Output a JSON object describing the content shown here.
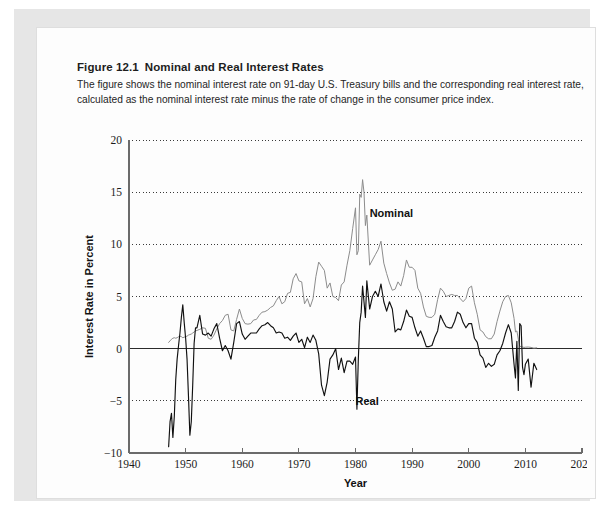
{
  "figure": {
    "number": "Figure 12.1",
    "title": "Nominal and Real Interest Rates",
    "description": "The figure shows the nominal interest rate on 91-day U.S. Treasury bills and the corresponding real interest rate, calculated as the nominal interest rate minus the rate of change in the consumer price index."
  },
  "colors": {
    "nominal": "#8c8c8c",
    "real": "#111111",
    "gridline": "#3a3a3a",
    "axis": "#6b6b6b",
    "zero_line": "#2b2b2b",
    "page_background": "#e6e6e6",
    "card_background": "#fdfdfd"
  },
  "chart_data": {
    "type": "line",
    "title": "Nominal and Real Interest Rates",
    "xlabel": "Year",
    "ylabel": "Interest Rate in Percent",
    "xlim": [
      1940,
      2020
    ],
    "ylim": [
      -10,
      20
    ],
    "xticks": [
      1940,
      1950,
      1960,
      1970,
      1980,
      1990,
      2000,
      2010,
      2020
    ],
    "yticks": [
      -10,
      -5,
      0,
      5,
      10,
      15,
      20
    ],
    "grid": "horizontal-dotted",
    "legend": "inline-annotations",
    "annotations": [
      {
        "text": "Nominal",
        "x": 1982.5,
        "y": 12.6
      },
      {
        "text": "Real",
        "x": 1980.0,
        "y": -5.4
      }
    ],
    "x": [
      1947.0,
      1947.25,
      1947.5,
      1947.75,
      1948.0,
      1948.25,
      1948.5,
      1948.75,
      1949.0,
      1949.25,
      1949.5,
      1949.75,
      1950.0,
      1950.25,
      1950.5,
      1950.75,
      1951.0,
      1951.25,
      1951.5,
      1951.75,
      1952.0,
      1952.5,
      1953.0,
      1953.5,
      1954.0,
      1954.5,
      1955.0,
      1955.5,
      1956.0,
      1956.5,
      1957.0,
      1957.5,
      1958.0,
      1958.5,
      1959.0,
      1959.5,
      1960.0,
      1960.5,
      1961.0,
      1961.5,
      1962.0,
      1962.5,
      1963.0,
      1963.5,
      1964.0,
      1964.5,
      1965.0,
      1965.5,
      1966.0,
      1966.5,
      1967.0,
      1967.5,
      1968.0,
      1968.5,
      1969.0,
      1969.5,
      1970.0,
      1970.5,
      1971.0,
      1971.5,
      1972.0,
      1972.5,
      1973.0,
      1973.5,
      1974.0,
      1974.5,
      1975.0,
      1975.5,
      1976.0,
      1976.5,
      1977.0,
      1977.5,
      1978.0,
      1978.5,
      1979.0,
      1979.5,
      1980.0,
      1980.25,
      1980.5,
      1980.75,
      1981.0,
      1981.25,
      1981.5,
      1981.75,
      1982.0,
      1982.5,
      1983.0,
      1983.5,
      1984.0,
      1984.5,
      1985.0,
      1985.5,
      1986.0,
      1986.5,
      1987.0,
      1987.5,
      1988.0,
      1988.5,
      1989.0,
      1989.5,
      1990.0,
      1990.5,
      1991.0,
      1991.5,
      1992.0,
      1992.5,
      1993.0,
      1993.5,
      1994.0,
      1994.5,
      1995.0,
      1995.5,
      1996.0,
      1996.5,
      1997.0,
      1997.5,
      1998.0,
      1998.5,
      1999.0,
      1999.5,
      2000.0,
      2000.5,
      2001.0,
      2001.5,
      2002.0,
      2002.5,
      2003.0,
      2003.5,
      2004.0,
      2004.5,
      2005.0,
      2005.5,
      2006.0,
      2006.5,
      2007.0,
      2007.5,
      2008.0,
      2008.25,
      2008.5,
      2008.75,
      2009.0,
      2009.25,
      2009.5,
      2009.75,
      2010.0,
      2010.5,
      2011.0,
      2011.5,
      2012.0
    ],
    "series": [
      {
        "name": "Nominal",
        "color": "#8c8c8c",
        "values": [
          0.6,
          0.75,
          0.9,
          1.0,
          1.05,
          1.0,
          1.05,
          1.15,
          1.2,
          1.15,
          1.05,
          1.1,
          1.15,
          1.2,
          1.3,
          1.35,
          1.4,
          1.5,
          1.6,
          1.7,
          1.75,
          1.85,
          2.0,
          1.95,
          1.0,
          0.9,
          1.3,
          1.9,
          2.4,
          2.7,
          3.2,
          3.3,
          1.8,
          1.7,
          2.8,
          3.8,
          2.9,
          2.4,
          2.35,
          2.4,
          2.75,
          2.8,
          3.2,
          3.5,
          3.55,
          3.7,
          3.95,
          4.1,
          4.6,
          5.0,
          4.3,
          4.5,
          5.3,
          5.4,
          6.7,
          7.2,
          6.5,
          6.4,
          4.3,
          4.8,
          4.0,
          4.8,
          6.9,
          8.3,
          7.9,
          7.5,
          5.8,
          6.3,
          5.0,
          4.9,
          4.6,
          6.1,
          6.4,
          8.0,
          9.4,
          11.5,
          13.5,
          9.0,
          9.4,
          14.8,
          14.5,
          16.2,
          15.0,
          11.8,
          12.8,
          8.0,
          8.5,
          9.0,
          9.5,
          10.3,
          8.2,
          7.2,
          6.3,
          5.6,
          5.7,
          6.4,
          6.0,
          7.0,
          8.5,
          7.8,
          7.8,
          7.5,
          5.8,
          5.3,
          4.0,
          3.1,
          3.0,
          3.0,
          3.3,
          4.7,
          5.8,
          5.5,
          5.0,
          5.1,
          5.2,
          5.1,
          5.1,
          4.8,
          4.5,
          4.8,
          5.8,
          6.0,
          4.4,
          3.3,
          1.8,
          1.6,
          1.15,
          0.95,
          0.95,
          1.4,
          2.6,
          3.6,
          4.5,
          5.0,
          5.1,
          4.4,
          2.9,
          1.6,
          1.7,
          0.9,
          0.25,
          0.17,
          0.16,
          0.12,
          0.14,
          0.16,
          0.12,
          0.05,
          0.08
        ]
      },
      {
        "name": "Real",
        "color": "#111111",
        "values": [
          -9.4,
          -7.0,
          -6.2,
          -8.5,
          -6.5,
          -3.0,
          -1.0,
          0.3,
          1.5,
          3.0,
          4.2,
          2.5,
          1.0,
          -1.0,
          -4.5,
          -8.3,
          -7.0,
          -3.5,
          0.5,
          2.0,
          2.0,
          3.2,
          1.4,
          1.3,
          1.5,
          1.2,
          1.9,
          2.4,
          1.0,
          -0.2,
          0.3,
          -0.2,
          -1.0,
          0.6,
          2.4,
          2.6,
          1.4,
          0.9,
          1.2,
          1.5,
          1.5,
          1.5,
          1.9,
          2.2,
          2.3,
          2.5,
          2.2,
          2.0,
          1.5,
          1.6,
          1.5,
          1.0,
          1.1,
          0.8,
          1.2,
          1.5,
          0.6,
          0.9,
          0.1,
          1.1,
          0.6,
          1.3,
          0.8,
          -0.5,
          -3.5,
          -4.5,
          -3.2,
          -1.0,
          -0.6,
          0.0,
          -2.0,
          -0.9,
          -2.3,
          -1.2,
          -1.2,
          -1.5,
          -0.8,
          -5.8,
          -1.0,
          2.5,
          3.5,
          6.0,
          4.5,
          3.0,
          6.5,
          3.8,
          5.0,
          5.5,
          5.0,
          6.2,
          4.5,
          3.6,
          4.5,
          3.8,
          1.6,
          1.9,
          1.8,
          2.6,
          3.7,
          3.1,
          3.0,
          2.0,
          1.2,
          1.7,
          1.0,
          0.2,
          0.2,
          0.3,
          1.1,
          1.7,
          3.2,
          2.6,
          2.1,
          2.0,
          2.0,
          2.6,
          3.5,
          3.3,
          2.5,
          2.0,
          2.4,
          2.4,
          1.0,
          0.6,
          -0.6,
          -0.9,
          -1.8,
          -1.4,
          -1.7,
          -1.5,
          -0.6,
          -0.2,
          0.5,
          1.5,
          2.3,
          1.5,
          -1.5,
          -2.8,
          0.7,
          -4.0,
          2.4,
          2.2,
          -1.8,
          -2.5,
          -1.5,
          -1.0,
          -3.7,
          -1.4,
          -2.0
        ]
      }
    ]
  }
}
